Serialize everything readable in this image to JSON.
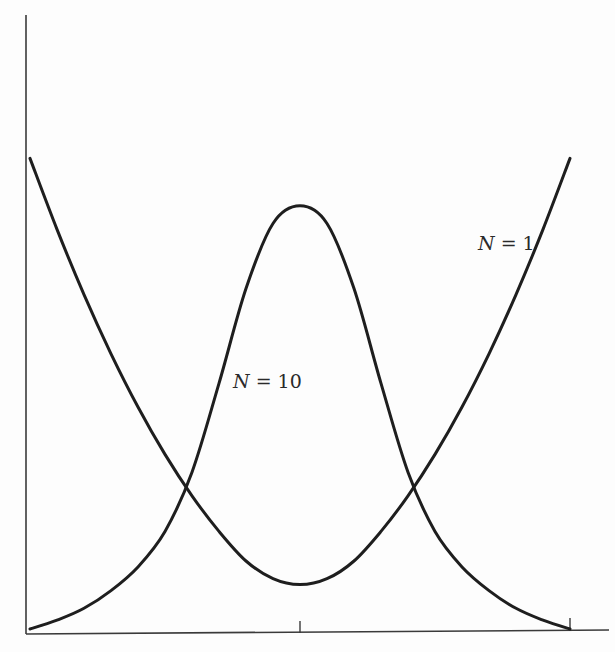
{
  "chart_data": {
    "type": "line",
    "title": "",
    "xlabel": "",
    "ylabel": "",
    "grid": false,
    "legend": "none (inline curve labels)",
    "xlim": [
      0,
      1
    ],
    "ylim": [
      0,
      1
    ],
    "x_ticks": [
      0.5,
      1.0
    ],
    "x_tick_labels": [
      "",
      ""
    ],
    "series": [
      {
        "name": "N = 1",
        "label_var": "N",
        "label_rest": " = 1",
        "shape": "convex U-shaped, minimum at center",
        "x": [
          0.0,
          0.05,
          0.1,
          0.15,
          0.2,
          0.25,
          0.3,
          0.35,
          0.4,
          0.45,
          0.5,
          0.55,
          0.6,
          0.65,
          0.7,
          0.75,
          0.8,
          0.85,
          0.9,
          0.95,
          1.0
        ],
        "values": [
          0.8,
          0.68,
          0.57,
          0.47,
          0.38,
          0.3,
          0.23,
          0.17,
          0.12,
          0.09,
          0.08,
          0.09,
          0.12,
          0.17,
          0.23,
          0.3,
          0.38,
          0.47,
          0.57,
          0.68,
          0.8
        ]
      },
      {
        "name": "N = 10",
        "label_var": "N",
        "label_rest": " = 10",
        "shape": "bell-shaped, peak at center",
        "x": [
          0.0,
          0.05,
          0.1,
          0.15,
          0.2,
          0.25,
          0.3,
          0.35,
          0.4,
          0.45,
          0.5,
          0.55,
          0.6,
          0.65,
          0.7,
          0.75,
          0.8,
          0.85,
          0.9,
          0.95,
          1.0
        ],
        "values": [
          0.005,
          0.02,
          0.04,
          0.07,
          0.11,
          0.17,
          0.27,
          0.42,
          0.58,
          0.69,
          0.72,
          0.69,
          0.58,
          0.42,
          0.27,
          0.17,
          0.11,
          0.07,
          0.04,
          0.02,
          0.005
        ]
      }
    ],
    "annotations": [
      {
        "text": "N = 1",
        "near_x": 0.85,
        "near_y": 0.67
      },
      {
        "text": "N = 10",
        "near_x": 0.4,
        "near_y": 0.43
      }
    ]
  },
  "labels": {
    "n1": {
      "var": "N",
      "rest": " = 1"
    },
    "n10": {
      "var": "N",
      "rest": " = 10"
    }
  }
}
